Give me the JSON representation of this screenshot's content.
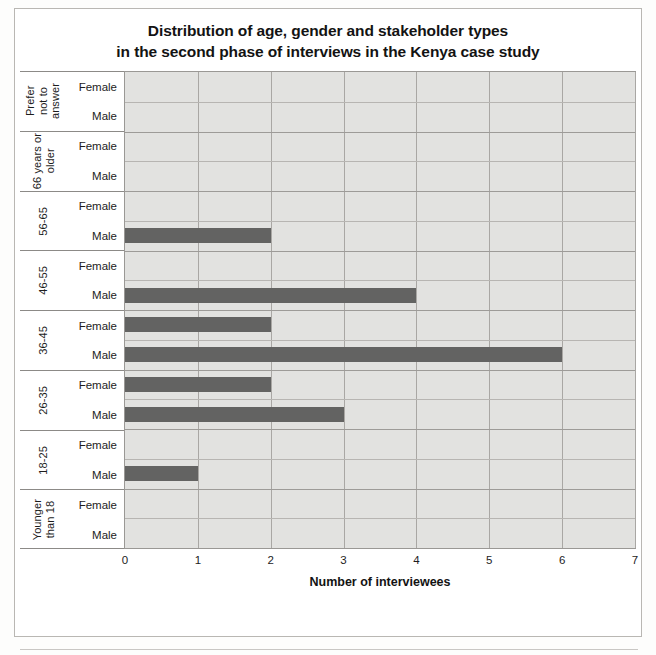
{
  "figure": {
    "title_line1": "Distribution of age, gender and stakeholder types",
    "title_line2": "in the second phase of interviews in the Kenya case study"
  },
  "page_ghost": [
    "of 1 4 b",
    "A R U T a",
    "T F Tatu n ou the report for the details",
    "m g ue are in ene o and",
    "the hat in the en ase",
    "I n ten men an e a e"
  ],
  "chart_data": {
    "type": "bar",
    "orientation": "horizontal",
    "title": "Distribution of age, gender and stakeholder types in the second phase of interviews in the Kenya case study",
    "xlabel": "Number of interviewees",
    "ylabel": "",
    "xlim": [
      0,
      7
    ],
    "xticks": [
      0,
      1,
      2,
      3,
      4,
      5,
      6,
      7
    ],
    "grid": true,
    "legend_position": "bottom",
    "bar_color": "#636362",
    "plot_background": "#e2e2e0",
    "series": [
      {
        "name": "CBM members",
        "color": "#636362",
        "values": [
          0,
          0,
          0,
          0,
          0,
          0,
          0,
          2,
          0,
          2,
          0,
          0,
          0,
          0,
          0,
          0
        ]
      },
      {
        "name": "Ground Truth 2.0 team members",
        "color": "#5e5e5e",
        "values": [
          0,
          0,
          0,
          0,
          0,
          2,
          0,
          4,
          2,
          6,
          2,
          3,
          0,
          1,
          0,
          0
        ]
      }
    ],
    "groups": [
      {
        "age": "Prefer not to answer",
        "age_lines": "Prefer\nnot to\nanswer",
        "rows": [
          {
            "gender": "Female",
            "value": 0
          },
          {
            "gender": "Male",
            "value": 0
          }
        ]
      },
      {
        "age": "66 years or older",
        "age_lines": "66 years or\nolder",
        "rows": [
          {
            "gender": "Female",
            "value": 0
          },
          {
            "gender": "Male",
            "value": 0
          }
        ]
      },
      {
        "age": "56-65",
        "age_lines": "56-65",
        "rows": [
          {
            "gender": "Female",
            "value": 0
          },
          {
            "gender": "Male",
            "value": 2
          }
        ]
      },
      {
        "age": "46-55",
        "age_lines": "46-55",
        "rows": [
          {
            "gender": "Female",
            "value": 0
          },
          {
            "gender": "Male",
            "value": 4
          }
        ]
      },
      {
        "age": "36-45",
        "age_lines": "36-45",
        "rows": [
          {
            "gender": "Female",
            "value": 2
          },
          {
            "gender": "Male",
            "value": 6
          }
        ]
      },
      {
        "age": "26-35",
        "age_lines": "26-35",
        "rows": [
          {
            "gender": "Female",
            "value": 2
          },
          {
            "gender": "Male",
            "value": 3
          }
        ]
      },
      {
        "age": "18-25",
        "age_lines": "18-25",
        "rows": [
          {
            "gender": "Female",
            "value": 0
          },
          {
            "gender": "Male",
            "value": 1
          }
        ]
      },
      {
        "age": "Younger than 18",
        "age_lines": "Younger\nthan 18",
        "rows": [
          {
            "gender": "Female",
            "value": 0
          },
          {
            "gender": "Male",
            "value": 0
          }
        ]
      }
    ],
    "legend": [
      {
        "label": "CBM members",
        "color": "#636362"
      },
      {
        "label": "Ground Truth 2.0 team members",
        "color": "#5e5e5e"
      }
    ]
  }
}
